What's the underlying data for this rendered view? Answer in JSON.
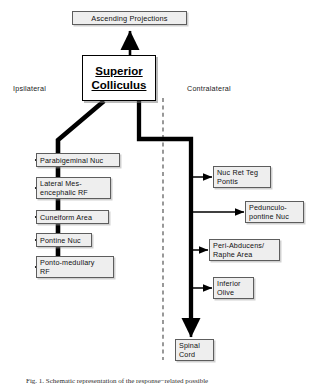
{
  "figure": {
    "title_node": {
      "label": "Ascending  Projections"
    },
    "hub": {
      "line1": "Superior ",
      "line2": "Colliculus"
    },
    "side_labels": {
      "left": "Ipsilateral",
      "right": "Contralateral"
    },
    "midline": {
      "style": "dashed",
      "color": "#555555"
    },
    "colors": {
      "trunk": "#000000",
      "box_fill": "#eeeeee",
      "box_border": "#5d5d5d",
      "hub_border": "#000000",
      "text": "#111111"
    },
    "ipsilateral_targets": [
      {
        "label": "Parabigeminal  Nuc"
      },
      {
        "label": "Lateral  Mes-\nencephalic RF"
      },
      {
        "label": "Cuneiform  Area"
      },
      {
        "label": "Pontine Nuc"
      },
      {
        "label": "Ponto-medullary\nRF"
      }
    ],
    "contralateral_targets": [
      {
        "label": "Nuc Ret Teg\n  Pontis"
      },
      {
        "label": "Pedunculo-\npontine Nuc"
      },
      {
        "label": "Peri-Abducens/\nRaphe Area"
      },
      {
        "label": "Inferior\nOlive"
      },
      {
        "label": "Spinal\nCord"
      }
    ],
    "caption": "Fig. 1. Schematic representation of the response−related possible"
  }
}
